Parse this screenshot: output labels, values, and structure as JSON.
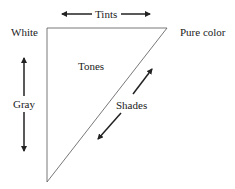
{
  "diagram": {
    "labels": {
      "tints": "Tints",
      "white": "White",
      "pure_color": "Pure color",
      "tones": "Tones",
      "gray": "Gray",
      "shades": "Shades"
    },
    "colors": {
      "stroke": "#222222",
      "triangle_edge": "#555555",
      "background": "#ffffff"
    },
    "triangle": {
      "vertices": [
        [
          47,
          28
        ],
        [
          167,
          28
        ],
        [
          47,
          182
        ]
      ]
    },
    "arrows": {
      "tints": {
        "from": [
          62,
          14
        ],
        "to": [
          150,
          14
        ],
        "direction": "both"
      },
      "gray": {
        "from": [
          24,
          58
        ],
        "to": [
          24,
          151
        ],
        "direction": "both"
      },
      "shades": {
        "from": [
          152,
          69
        ],
        "to": [
          98,
          139
        ],
        "direction": "both"
      }
    }
  }
}
